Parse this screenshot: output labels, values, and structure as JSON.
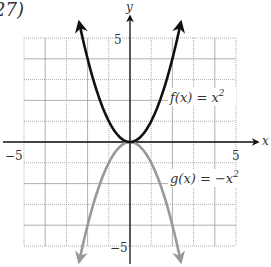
{
  "problem_number": "27)",
  "chart_data": {
    "type": "line",
    "title": "",
    "xlabel": "x",
    "ylabel": "y",
    "xlim": [
      -5,
      5
    ],
    "ylim": [
      -5,
      5
    ],
    "grid": true,
    "tick_labels": {
      "x": [
        {
          "value": -5,
          "label": "−5"
        },
        {
          "value": 5,
          "label": "5"
        }
      ],
      "y": [
        {
          "value": 5,
          "label": "5"
        },
        {
          "value": -5,
          "label": "−5"
        }
      ]
    },
    "series": [
      {
        "name": "f(x) = x²",
        "expression": "x^2",
        "color": "#111111",
        "x_range": [
          -2.4,
          2.4
        ],
        "arrows": "both-ends"
      },
      {
        "name": "g(x) = −x²",
        "expression": "-x^2",
        "color": "#999999",
        "x_range": [
          -2.4,
          2.4
        ],
        "arrows": "both-ends"
      }
    ],
    "annotations": [
      {
        "text": "f(x) = x²",
        "near": {
          "x": 2,
          "y": 1.9
        }
      },
      {
        "text": "g(x) = −x²",
        "near": {
          "x": 2,
          "y": -1.9
        }
      }
    ]
  },
  "labels": {
    "x_axis": "x",
    "y_axis": "y",
    "x_min": "−5",
    "x_max": "5",
    "y_max": "5",
    "y_min": "−5",
    "f_name": "f(x) = x",
    "g_name": "g(x) = −x",
    "exp": "2"
  }
}
